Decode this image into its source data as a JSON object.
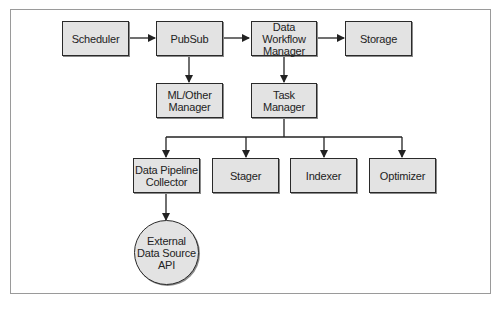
{
  "diagram": {
    "nodes": {
      "scheduler": "Scheduler",
      "pubsub": "PubSub",
      "data_workflow_manager": "Data Workflow\nManager",
      "storage": "Storage",
      "ml_other_manager": "ML/Other\nManager",
      "task_manager": "Task\nManager",
      "data_pipeline_collector": "Data Pipeline\nCollector",
      "stager": "Stager",
      "indexer": "Indexer",
      "optimizer": "Optimizer",
      "external_data_source_api": "External\nData Source\nAPI"
    },
    "edges": [
      [
        "Scheduler",
        "PubSub"
      ],
      [
        "PubSub",
        "Data Workflow Manager"
      ],
      [
        "Data Workflow Manager",
        "Storage"
      ],
      [
        "PubSub",
        "ML/Other Manager"
      ],
      [
        "Data Workflow Manager",
        "Task Manager"
      ],
      [
        "Task Manager",
        "Data Pipeline Collector"
      ],
      [
        "Task Manager",
        "Stager"
      ],
      [
        "Task Manager",
        "Indexer"
      ],
      [
        "Task Manager",
        "Optimizer"
      ],
      [
        "Data Pipeline Collector",
        "External Data Source API"
      ]
    ],
    "colors": {
      "node_fill": "#e3e3e3",
      "node_border": "#2a2a2a",
      "edge": "#222222"
    }
  }
}
